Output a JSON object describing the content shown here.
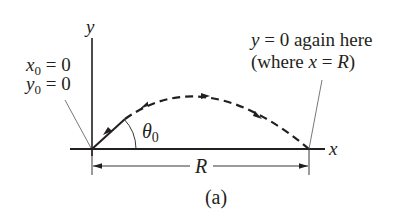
{
  "figure": {
    "caption": "(a)",
    "axes": {
      "x_label": "x",
      "y_label": "y"
    },
    "initial_conditions": {
      "x0_var": "x",
      "x0_sub": "0",
      "x0_eq": " = 0",
      "y0_var": "y",
      "y0_sub": "0",
      "y0_eq": " = 0"
    },
    "launch_angle": {
      "symbol": "θ",
      "sub": "0"
    },
    "range_label": "R",
    "landing_note": {
      "line1_var": "y",
      "line1_rest": " = 0 again here",
      "line2_open": "(where ",
      "line2_var": "x",
      "line2_eq": " = ",
      "line2_R": "R",
      "line2_close": ")"
    },
    "colors": {
      "ink": "#231f20",
      "leader": "#555555",
      "background": "#ffffff"
    }
  }
}
